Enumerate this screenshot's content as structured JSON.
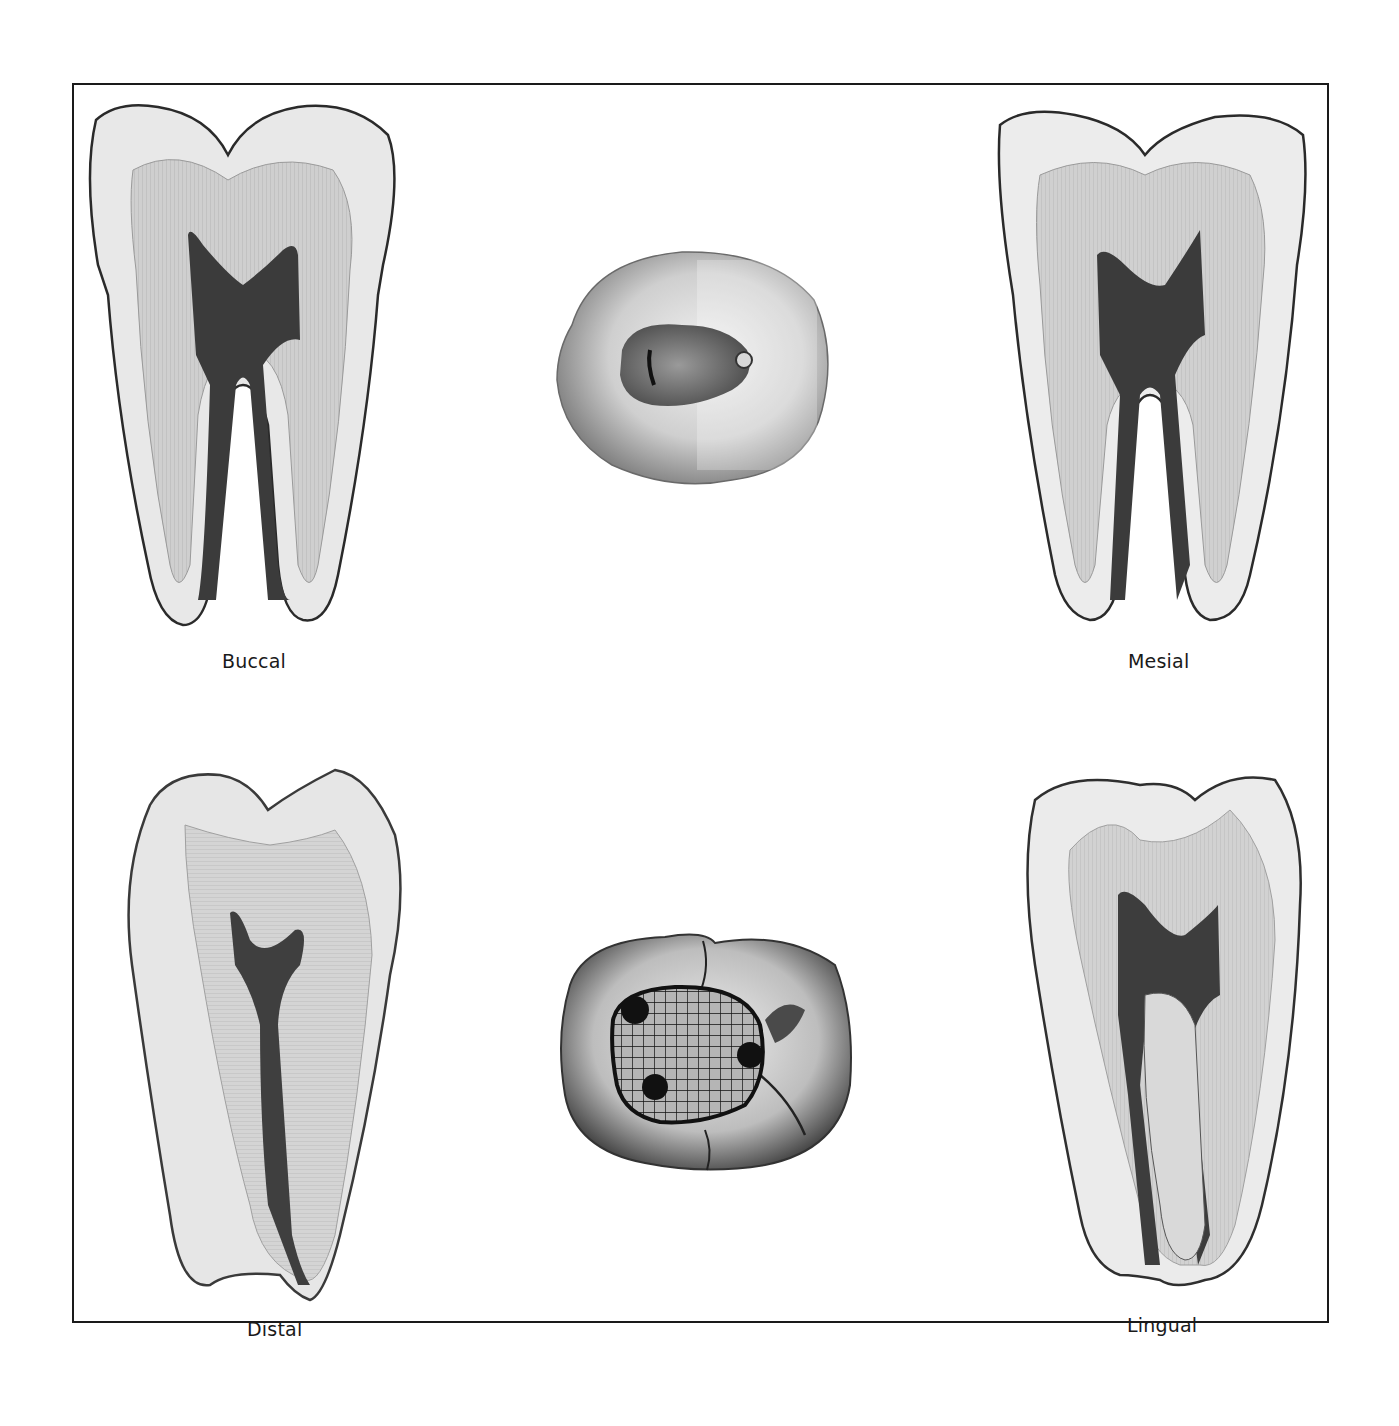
{
  "figure": {
    "frame": {
      "border_color": "#1a1a1a",
      "background": "#ffffff"
    },
    "views": [
      {
        "id": "buccal",
        "label": "Buccal",
        "type": "longitudinal-section"
      },
      {
        "id": "mesial",
        "label": "Mesial",
        "type": "longitudinal-section"
      },
      {
        "id": "distal",
        "label": "Distal",
        "type": "longitudinal-section"
      },
      {
        "id": "lingual",
        "label": "Lingual",
        "type": "longitudinal-section"
      },
      {
        "id": "occlusal-access",
        "label": "",
        "type": "occlusal-view-access-cavity"
      },
      {
        "id": "occlusal-outline",
        "label": "",
        "type": "occlusal-view-grid-outline"
      }
    ],
    "colors": {
      "enamel": "#e6e6e6",
      "dentin": "#c9c9c9",
      "pulp": "#3a3a3a",
      "outline": "#2a2a2a",
      "grid": "#111111"
    }
  }
}
